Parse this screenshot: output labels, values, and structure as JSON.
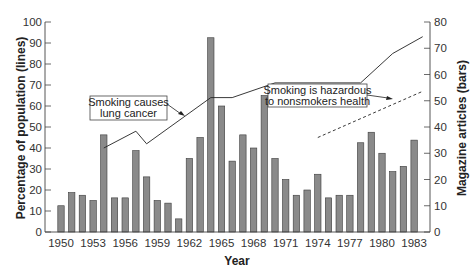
{
  "chart_data": {
    "type": "bar+line",
    "title": "",
    "xlabel": "Year",
    "ylabel_left": "Percentage of population (lines)",
    "ylabel_right": "Magazine articles (bars)",
    "ylim_left": [
      0,
      100
    ],
    "ylim_right": [
      0,
      80
    ],
    "left_ticks": [
      0,
      10,
      20,
      30,
      40,
      50,
      60,
      70,
      80,
      90,
      100
    ],
    "right_ticks": [
      0,
      10,
      20,
      30,
      40,
      50,
      60,
      70,
      80
    ],
    "x_tick_labels": [
      "1950",
      "1953",
      "1956",
      "1959",
      "1962",
      "1965",
      "1968",
      "1971",
      "1974",
      "1977",
      "1980",
      "1983"
    ],
    "grid": false,
    "categories": [
      1950,
      1951,
      1952,
      1953,
      1954,
      1955,
      1956,
      1957,
      1958,
      1959,
      1960,
      1961,
      1962,
      1963,
      1964,
      1965,
      1966,
      1967,
      1968,
      1969,
      1970,
      1971,
      1972,
      1973,
      1974,
      1975,
      1976,
      1977,
      1978,
      1979,
      1980,
      1981,
      1982,
      1983
    ],
    "series": [
      {
        "name": "Magazine articles",
        "kind": "bar",
        "axis": "right",
        "values": [
          10,
          15,
          14,
          12,
          37,
          13,
          13,
          31,
          21,
          12,
          11,
          5,
          28,
          36,
          74,
          48,
          27,
          37,
          32,
          52,
          28,
          20,
          14,
          16,
          22,
          13,
          14,
          14,
          34,
          38,
          30,
          23,
          25,
          35
        ]
      },
      {
        "name": "Smoking causes lung cancer",
        "kind": "line",
        "style": "solid",
        "axis": "left",
        "points": [
          [
            1954,
            40
          ],
          [
            1957,
            48
          ],
          [
            1958,
            42
          ],
          [
            1964,
            64
          ],
          [
            1966,
            64
          ],
          [
            1970,
            71
          ],
          [
            1978,
            71
          ],
          [
            1981,
            85
          ],
          [
            1983.8,
            93
          ]
        ]
      },
      {
        "name": "Smoking is hazardous to nonsmokers health",
        "kind": "line",
        "style": "dashed",
        "axis": "left",
        "points": [
          [
            1974,
            45
          ],
          [
            1983.8,
            67
          ]
        ]
      }
    ],
    "annotations": [
      {
        "lines": [
          "Smoking causes",
          "lung cancer"
        ],
        "points_to_series": "Smoking causes lung cancer"
      },
      {
        "lines": [
          "Smoking is hazardous",
          "to nonsmokers health"
        ],
        "points_to_series": "Smoking is hazardous to nonsmokers health"
      }
    ]
  },
  "colors": {
    "bar_fill": "#8a8a8a",
    "bar_stroke": "#3a3a3a",
    "line": "#222222",
    "axis": "#444444"
  }
}
